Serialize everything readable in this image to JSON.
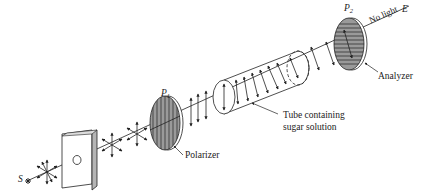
{
  "diagram": {
    "labels": {
      "source": "S",
      "end": "E",
      "p1": "P",
      "p1_sub": "1",
      "p2": "P",
      "p2_sub": "2",
      "polarizer": "Polarizer",
      "analyzer": "Analyzer",
      "tube_line1": "Tube containing",
      "tube_line2": "sugar solution",
      "no_light": "No light"
    },
    "components": [
      {
        "id": "source",
        "name": "Light source S"
      },
      {
        "id": "aperture",
        "name": "Plate with pinhole"
      },
      {
        "id": "polarizer",
        "name": "Polarizer P1 (vertical lines)"
      },
      {
        "id": "tube",
        "name": "Tube containing sugar solution"
      },
      {
        "id": "analyzer",
        "name": "Analyzer P2 (horizontal lines)"
      },
      {
        "id": "end",
        "name": "Observer E (no light)"
      }
    ],
    "colors": {
      "line": "#222222",
      "filter_fill": "#9a9a9a",
      "plate_side": "#b5b5b5",
      "background": "#ffffff"
    }
  }
}
